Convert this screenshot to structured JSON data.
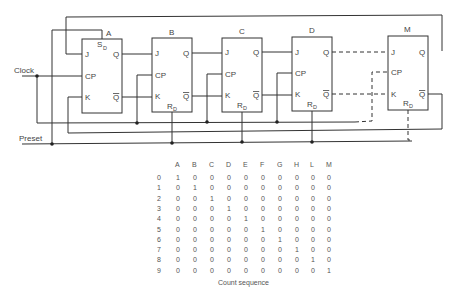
{
  "diagram": {
    "inputs": {
      "clock": "Clock",
      "preset": "Preset"
    },
    "flip_flops": [
      {
        "name": "A",
        "pins": [
          "J",
          "CP",
          "K",
          "Q",
          "Q̄"
        ],
        "set_reset": "S",
        "set_reset_sub": "D"
      },
      {
        "name": "B",
        "pins": [
          "J",
          "CP",
          "K",
          "Q",
          "Q̄"
        ],
        "set_reset": "R",
        "set_reset_sub": "D"
      },
      {
        "name": "C",
        "pins": [
          "J",
          "CP",
          "K",
          "Q",
          "Q̄"
        ],
        "set_reset": "R",
        "set_reset_sub": "D"
      },
      {
        "name": "D",
        "pins": [
          "J",
          "CP",
          "K",
          "Q",
          "Q̄"
        ],
        "set_reset": "R",
        "set_reset_sub": "D"
      },
      {
        "name": "M",
        "pins": [
          "J",
          "CP",
          "K",
          "Q",
          "Q̄"
        ],
        "set_reset": "R",
        "set_reset_sub": "D"
      }
    ],
    "pin_labels": {
      "j": "J",
      "cp": "CP",
      "k": "K",
      "q": "Q",
      "qbar": "Q"
    }
  },
  "count_table": {
    "caption": "Count sequence",
    "headers": [
      "A",
      "B",
      "C",
      "D",
      "E",
      "F",
      "G",
      "H",
      "L",
      "M"
    ],
    "rows": [
      {
        "n": "0",
        "v": [
          "1",
          "0",
          "0",
          "0",
          "0",
          "0",
          "0",
          "0",
          "0",
          "0"
        ]
      },
      {
        "n": "1",
        "v": [
          "0",
          "1",
          "0",
          "0",
          "0",
          "0",
          "0",
          "0",
          "0",
          "0"
        ]
      },
      {
        "n": "2",
        "v": [
          "0",
          "0",
          "1",
          "0",
          "0",
          "0",
          "0",
          "0",
          "0",
          "0"
        ]
      },
      {
        "n": "3",
        "v": [
          "0",
          "0",
          "0",
          "1",
          "0",
          "0",
          "0",
          "0",
          "0",
          "0"
        ]
      },
      {
        "n": "4",
        "v": [
          "0",
          "0",
          "0",
          "0",
          "1",
          "0",
          "0",
          "0",
          "0",
          "0"
        ]
      },
      {
        "n": "5",
        "v": [
          "0",
          "0",
          "0",
          "0",
          "0",
          "1",
          "0",
          "0",
          "0",
          "0"
        ]
      },
      {
        "n": "6",
        "v": [
          "0",
          "0",
          "0",
          "0",
          "0",
          "0",
          "1",
          "0",
          "0",
          "0"
        ]
      },
      {
        "n": "7",
        "v": [
          "0",
          "0",
          "0",
          "0",
          "0",
          "0",
          "0",
          "1",
          "0",
          "0"
        ]
      },
      {
        "n": "8",
        "v": [
          "0",
          "0",
          "0",
          "0",
          "0",
          "0",
          "0",
          "0",
          "1",
          "0"
        ]
      },
      {
        "n": "9",
        "v": [
          "0",
          "0",
          "0",
          "0",
          "0",
          "0",
          "0",
          "0",
          "0",
          "1"
        ]
      }
    ]
  }
}
